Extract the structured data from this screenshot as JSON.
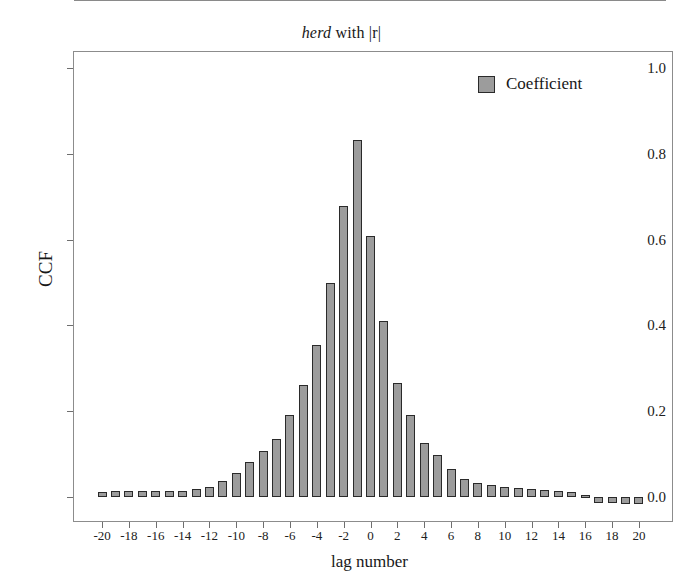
{
  "chart_data": {
    "type": "bar",
    "title": "herd with |r|",
    "title_italic_part": "herd",
    "title_rest": " with |r|",
    "xlabel": "lag number",
    "ylabel": "CCF",
    "xlim": [
      -21,
      21
    ],
    "ylim": [
      -0.08,
      1.06
    ],
    "ytick_labels": [
      "0.0",
      "0.2",
      "0.4",
      "0.6",
      "0.8",
      "1.0"
    ],
    "ytick_values": [
      0.0,
      0.2,
      0.4,
      0.6,
      0.8,
      1.0
    ],
    "xtick_labels": [
      "-20",
      "-18",
      "-16",
      "-14",
      "-12",
      "-10",
      "-8",
      "-6",
      "-4",
      "-2",
      "0",
      "2",
      "4",
      "6",
      "8",
      "10",
      "12",
      "14",
      "16",
      "18",
      "20"
    ],
    "xtick_values": [
      -20,
      -18,
      -16,
      -14,
      -12,
      -10,
      -8,
      -6,
      -4,
      -2,
      0,
      2,
      4,
      6,
      8,
      10,
      12,
      14,
      16,
      18,
      20
    ],
    "grid": false,
    "legend_position": "top-right",
    "legend": [
      {
        "name": "Coefficient",
        "color": "#9c9c9c"
      }
    ],
    "bar_color": "#9c9c9c",
    "bar_edge_color": "#2a2a2a",
    "categories": [
      -20,
      -19,
      -18,
      -17,
      -16,
      -15,
      -14,
      -13,
      -12,
      -11,
      -10,
      -9,
      -8,
      -7,
      -6,
      -5,
      -4,
      -3,
      -2,
      -1,
      0,
      1,
      2,
      3,
      4,
      5,
      6,
      7,
      8,
      9,
      10,
      11,
      12,
      13,
      14,
      15,
      16,
      17,
      18,
      19,
      20
    ],
    "series": [
      {
        "name": "Coefficient",
        "values": [
          0.011,
          0.013,
          0.013,
          0.014,
          0.014,
          0.013,
          0.014,
          0.018,
          0.023,
          0.038,
          0.055,
          0.082,
          0.108,
          0.135,
          0.19,
          0.26,
          0.355,
          0.5,
          0.678,
          0.832,
          0.609,
          0.41,
          0.266,
          0.19,
          0.126,
          0.098,
          0.066,
          0.042,
          0.032,
          0.027,
          0.024,
          0.021,
          0.019,
          0.017,
          0.015,
          0.012,
          0.004,
          -0.014,
          -0.015,
          -0.016,
          -0.017
        ]
      }
    ]
  }
}
